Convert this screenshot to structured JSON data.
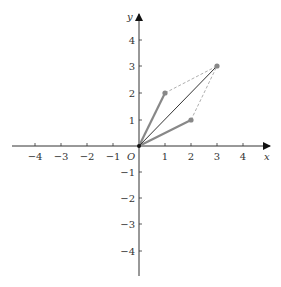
{
  "axes": {
    "x_label": "x",
    "y_label": "y",
    "origin_label": "O",
    "x_ticks": [
      "−4",
      "−3",
      "−2",
      "−1",
      "1",
      "2",
      "3",
      "4"
    ],
    "y_ticks": [
      "4",
      "3",
      "2",
      "1",
      "−1",
      "−2",
      "−3",
      "−4"
    ]
  },
  "vectors": [
    {
      "name": "vector-a",
      "from": [
        0,
        0
      ],
      "to": [
        1,
        2
      ],
      "color": "#888888"
    },
    {
      "name": "vector-b",
      "from": [
        0,
        0
      ],
      "to": [
        2,
        1
      ],
      "color": "#888888"
    },
    {
      "name": "vector-sum",
      "from": [
        0,
        0
      ],
      "to": [
        3,
        3
      ],
      "color": "#333333"
    }
  ],
  "dashed_lines": [
    {
      "from": [
        1,
        2
      ],
      "to": [
        3,
        3
      ]
    },
    {
      "from": [
        2,
        1
      ],
      "to": [
        3,
        3
      ]
    }
  ],
  "points": [
    [
      1,
      2
    ],
    [
      2,
      1
    ],
    [
      3,
      3
    ]
  ]
}
